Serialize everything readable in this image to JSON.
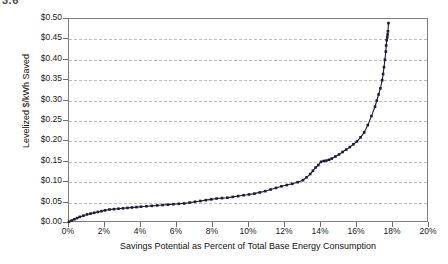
{
  "figure": {
    "number_label": "3.6"
  },
  "chart_data": {
    "type": "line",
    "title": "",
    "subtitle": "",
    "xlabel": "Savings Potential as Percent of Total Base Energy Consumption",
    "ylabel": "Levelized $/kWh Saved",
    "xlim": [
      0,
      20
    ],
    "ylim": [
      0.0,
      0.5
    ],
    "grid": "horizontal-dashed",
    "legend": "none",
    "marker": "small filled square",
    "series_color": "#1a1a3c",
    "x_tick_labels": [
      "0%",
      "2%",
      "4%",
      "6%",
      "8%",
      "10%",
      "12%",
      "14%",
      "16%",
      "18%",
      "20%"
    ],
    "x_tick_values": [
      0,
      2,
      4,
      6,
      8,
      10,
      12,
      14,
      16,
      18,
      20
    ],
    "y_tick_labels": [
      "$0.00",
      "$0.05",
      "$0.10",
      "$0.15",
      "$0.20",
      "$0.25",
      "$0.30",
      "$0.35",
      "$0.40",
      "$0.45",
      "$0.50"
    ],
    "y_tick_values": [
      0.0,
      0.05,
      0.1,
      0.15,
      0.2,
      0.25,
      0.3,
      0.35,
      0.4,
      0.45,
      0.5
    ],
    "series": [
      {
        "name": "Supply curve",
        "x": [
          0.0,
          0.15,
          0.3,
          0.45,
          0.6,
          0.8,
          1.0,
          1.2,
          1.4,
          1.6,
          1.8,
          2.0,
          2.25,
          2.5,
          2.75,
          3.0,
          3.25,
          3.5,
          3.75,
          4.0,
          4.3,
          4.6,
          4.9,
          5.2,
          5.5,
          5.8,
          6.1,
          6.4,
          6.7,
          7.0,
          7.3,
          7.6,
          7.9,
          8.2,
          8.5,
          8.8,
          9.1,
          9.4,
          9.7,
          10.0,
          10.3,
          10.6,
          10.9,
          11.2,
          11.5,
          11.8,
          12.1,
          12.4,
          12.7,
          13.0,
          13.2,
          13.4,
          13.55,
          13.7,
          13.85,
          14.0,
          14.15,
          14.3,
          14.45,
          14.6,
          14.8,
          15.0,
          15.2,
          15.4,
          15.6,
          15.8,
          16.0,
          16.2,
          16.4,
          16.6,
          16.8,
          17.0,
          17.1,
          17.2,
          17.3,
          17.4,
          17.45,
          17.5,
          17.55,
          17.6,
          17.62,
          17.65,
          17.68,
          17.7,
          17.72,
          17.75
        ],
        "y": [
          0.003,
          0.006,
          0.009,
          0.012,
          0.015,
          0.018,
          0.021,
          0.023,
          0.025,
          0.027,
          0.029,
          0.031,
          0.033,
          0.034,
          0.035,
          0.036,
          0.037,
          0.038,
          0.039,
          0.04,
          0.041,
          0.042,
          0.043,
          0.044,
          0.045,
          0.046,
          0.047,
          0.048,
          0.05,
          0.052,
          0.054,
          0.056,
          0.058,
          0.06,
          0.061,
          0.062,
          0.064,
          0.066,
          0.068,
          0.07,
          0.072,
          0.075,
          0.078,
          0.082,
          0.086,
          0.09,
          0.093,
          0.096,
          0.1,
          0.105,
          0.112,
          0.12,
          0.128,
          0.136,
          0.142,
          0.15,
          0.152,
          0.153,
          0.155,
          0.158,
          0.163,
          0.168,
          0.174,
          0.18,
          0.186,
          0.193,
          0.2,
          0.21,
          0.222,
          0.24,
          0.262,
          0.285,
          0.3,
          0.315,
          0.33,
          0.35,
          0.365,
          0.382,
          0.4,
          0.42,
          0.435,
          0.448,
          0.455,
          0.462,
          0.47,
          0.49
        ]
      }
    ]
  }
}
